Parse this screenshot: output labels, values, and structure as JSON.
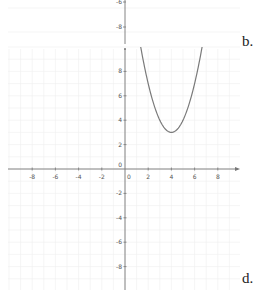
{
  "chart_data": {
    "type": "line",
    "title": "",
    "xlabel": "",
    "ylabel": "",
    "function": "y = (x - 4)^2 + 3",
    "vertex": [
      4,
      3
    ],
    "x": [
      1.35,
      2,
      3,
      4,
      5,
      6,
      6.65
    ],
    "values": [
      10,
      7,
      4,
      3,
      4,
      7,
      10
    ],
    "xlim": [
      -10.2,
      9.9
    ],
    "ylim": [
      -10,
      10
    ],
    "x_ticks": [
      -8,
      -6,
      -4,
      -2,
      0,
      2,
      4,
      6,
      8
    ],
    "y_ticks": [
      8,
      6,
      4,
      2,
      0,
      -2,
      -4,
      -6,
      -8
    ],
    "grid": true,
    "curve_color": "#7a7a7a",
    "axis_color": "#777777",
    "grid_color": "#eeeeee",
    "residual_top_labels": [
      "-6",
      "-8"
    ]
  },
  "labels": {
    "option_b": "b.",
    "option_d": "d."
  }
}
